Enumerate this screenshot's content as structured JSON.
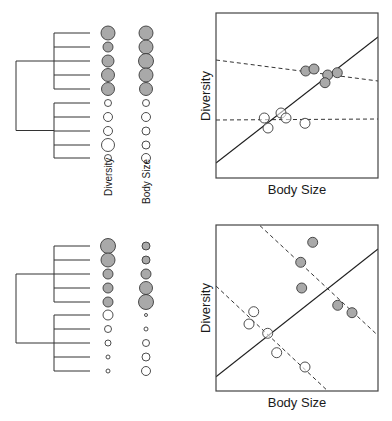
{
  "panels": [
    {
      "id": "top",
      "tree": {
        "root_x": 16,
        "clade_x": 54,
        "leaf_x": 90,
        "leaf_y": [
          33,
          47,
          61,
          75,
          89,
          103,
          117,
          131,
          145,
          158
        ],
        "clades": [
          [
            0,
            4
          ],
          [
            5,
            9
          ]
        ]
      },
      "trait_columns": {
        "diversity_x": 108,
        "body_size_x": 146,
        "diversity_r": [
          7,
          5,
          6,
          6.5,
          6.5,
          3.5,
          4.5,
          4.5,
          6.5,
          3.5
        ],
        "body_size_r": [
          7,
          7,
          7.5,
          7,
          6.5,
          3.5,
          4.5,
          4,
          4,
          4.5
        ],
        "filled": [
          true,
          true,
          true,
          true,
          true,
          false,
          false,
          false,
          false,
          false
        ]
      },
      "labels": {
        "diversity": "Diversity",
        "body_size": "Body Size"
      },
      "scatter": {
        "box": [
          216,
          13,
          378,
          178
        ],
        "xlabel": "Body Size",
        "ylabel": "Diversity",
        "filled_points": [
          [
            305.7,
            71
          ],
          [
            314,
            69
          ],
          [
            327.7,
            75
          ],
          [
            337.3,
            72.7
          ],
          [
            325,
            82.7
          ]
        ],
        "open_points": [
          [
            264.3,
            118
          ],
          [
            268,
            128
          ],
          [
            281,
            113
          ],
          [
            286,
            118
          ],
          [
            305,
            123.3
          ]
        ],
        "solid_line": [
          [
            216,
            163
          ],
          [
            378,
            37
          ]
        ],
        "dashed_lines": [
          [
            [
              216,
              60
            ],
            [
              378,
              81
            ]
          ],
          [
            [
              216,
              120
            ],
            [
              378,
              119
            ]
          ]
        ]
      }
    },
    {
      "id": "bottom",
      "tree": {
        "root_x": 16,
        "clade_x": 54,
        "leaf_x": 90,
        "leaf_y": [
          246,
          260,
          274,
          288,
          302,
          315,
          329,
          343,
          357,
          371
        ],
        "clades": [
          [
            0,
            4
          ],
          [
            5,
            9
          ]
        ]
      },
      "trait_columns": {
        "diversity_x": 108,
        "body_size_x": 146,
        "diversity_r": [
          7.5,
          7,
          5,
          5,
          5,
          5,
          3.5,
          3,
          2,
          2
        ],
        "body_size_r": [
          4,
          4,
          5,
          6.5,
          7.5,
          1.5,
          2,
          3.5,
          4,
          4.5
        ],
        "filled": [
          true,
          true,
          true,
          true,
          true,
          false,
          false,
          false,
          false,
          false
        ]
      },
      "labels": {
        "diversity": "Diversity",
        "body_size": "Body Size"
      },
      "scatter": {
        "box": [
          216,
          225,
          378,
          391
        ],
        "xlabel": "Body Size",
        "ylabel": "Diversity",
        "filled_points": [
          [
            312.7,
            242.3
          ],
          [
            300.7,
            262.3
          ],
          [
            301.7,
            288
          ],
          [
            337.7,
            305.3
          ],
          [
            352,
            312.7
          ]
        ],
        "open_points": [
          [
            253.7,
            311.7
          ],
          [
            249,
            324
          ],
          [
            267.7,
            333.3
          ],
          [
            276.7,
            352.7
          ],
          [
            305,
            367
          ]
        ],
        "solid_line": [
          [
            216,
            376.7
          ],
          [
            378,
            249
          ]
        ],
        "dashed_lines": [
          [
            [
              260,
              225.7
            ],
            [
              376.7,
              334.3
            ]
          ],
          [
            [
              216,
              286
            ],
            [
              326,
              389.3
            ]
          ]
        ]
      }
    }
  ],
  "style": {
    "filled_color": "#a9a9a9",
    "stroke_color": "#3a3a3a",
    "line_color": "#1f1f1f",
    "dashed_color": "#333333"
  },
  "text": {
    "top_diversity_label": "Diversity",
    "top_body_size_label": "Body Size",
    "top_xlabel": "Body Size",
    "top_ylabel": "Diversity",
    "bottom_xlabel": "Body Size",
    "bottom_ylabel": "Diversity"
  }
}
